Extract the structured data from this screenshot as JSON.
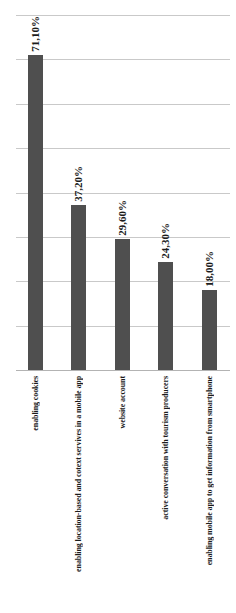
{
  "chart_data": {
    "type": "bar",
    "categories": [
      "enabling cookies",
      "enabling location-based and cotext servives in a mobile app",
      "website account",
      "active conversation with tourism producers",
      "enabling mobile app to get information from smartphone"
    ],
    "values": [
      71.1,
      37.2,
      29.6,
      24.3,
      18.0
    ],
    "data_labels": [
      "71,10%",
      "37,20%",
      "29,60%",
      "24,30%",
      "18,00%"
    ],
    "title": "",
    "xlabel": "",
    "ylabel": "",
    "ylim": [
      0,
      80
    ],
    "gridline_interval": 10,
    "grid": "horizontal",
    "legend": "none",
    "label_rotation": "90deg reading bottom-to-top",
    "axis_tick_labels_visible": false,
    "colors": {
      "bar": "#4f4f4f",
      "gridline": "#c9c9c9",
      "axis_line": "#b3b3b3",
      "text": "#1c1c1c",
      "background": "#ffffff"
    }
  }
}
